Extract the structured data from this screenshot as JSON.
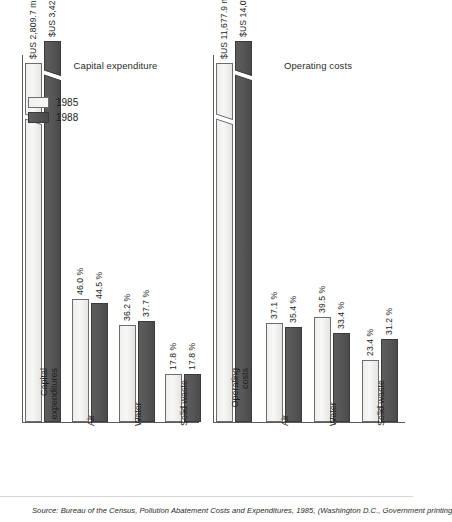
{
  "page_title": "Pollution abatement expenditures",
  "legend": {
    "items": [
      {
        "label": "1985",
        "key": "y1985",
        "color": "#f3f3f2"
      },
      {
        "label": "1988",
        "key": "y1988",
        "color": "#565656"
      }
    ]
  },
  "source": {
    "text": "Source: Bureau of the Census, Pollution Abatement Costs and Expenditures, 1985, (Washington D.C., Government printing"
  },
  "chart_data": [
    {
      "type": "bar",
      "title": "Capital expenditure",
      "xlabel": "",
      "ylabel": "",
      "grid": false,
      "legend_position": "top-left",
      "categories": [
        "Capital expenditures",
        "Air",
        "Water",
        "Solid waste"
      ],
      "value_labels": {
        "1985": [
          "$US 2,809.7 million",
          "46.0 %",
          "36.2 %",
          "17.8 %"
        ],
        "1988": [
          "$US 3,423.3 million",
          "44.5 %",
          "37.7 %",
          "17.8 %"
        ]
      },
      "series": [
        {
          "name": "1985",
          "values": [
            100,
            46.0,
            36.2,
            17.8
          ]
        },
        {
          "name": "1988",
          "values": [
            100,
            44.5,
            37.7,
            17.8
          ]
        }
      ],
      "ylim": [
        0,
        100
      ],
      "axis_break": true
    },
    {
      "type": "bar",
      "title": "Operating costs",
      "xlabel": "",
      "ylabel": "",
      "grid": false,
      "legend_position": "top-left",
      "categories": [
        "Operating costs",
        "Air",
        "Water",
        "Solid waste"
      ],
      "value_labels": {
        "1985": [
          "$US 11,677.9 million",
          "37.1 %",
          "39.5 %",
          "23.4 %"
        ],
        "1988": [
          "$US 14,008.6 million",
          "35.4 %",
          "33.4 %",
          "31.2 %"
        ]
      },
      "series": [
        {
          "name": "1985",
          "values": [
            100,
            37.1,
            39.5,
            23.4
          ]
        },
        {
          "name": "1988",
          "values": [
            100,
            35.4,
            33.4,
            31.2
          ]
        }
      ],
      "ylim": [
        0,
        100
      ],
      "axis_break": true
    }
  ]
}
